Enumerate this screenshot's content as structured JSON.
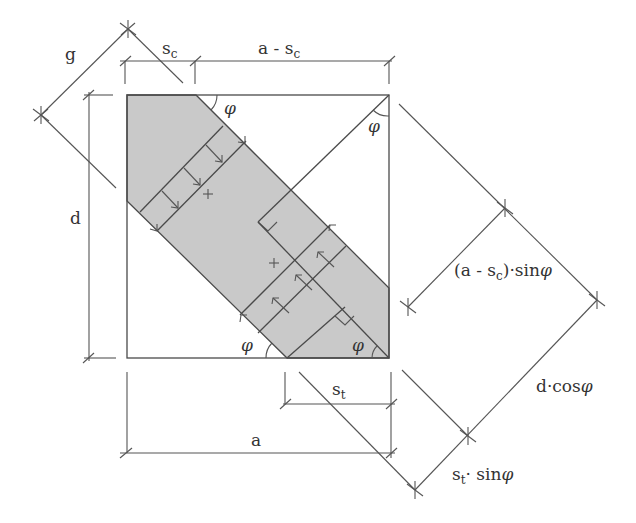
{
  "figure": {
    "colors": {
      "line": "#4a4a4a",
      "shading": "#c8c8c8",
      "background": "#ffffff"
    }
  },
  "labels": {
    "g": "g",
    "sc_base": "s",
    "sc_sub": "c",
    "a_minus_sc_prefix": "a - s",
    "a_minus_sc_sub": "c",
    "d": "d",
    "a": "a",
    "st_base": "s",
    "st_sub": "t",
    "phi": "φ",
    "a_sc_sin_prefix": "(a - s",
    "a_sc_sin_sub": "c",
    "a_sc_sin_suffix": ")·sin",
    "d_cos_prefix": "d·cos",
    "st_sin_base": "s",
    "st_sin_sub": "t",
    "st_sin_suffix": "· sin"
  }
}
